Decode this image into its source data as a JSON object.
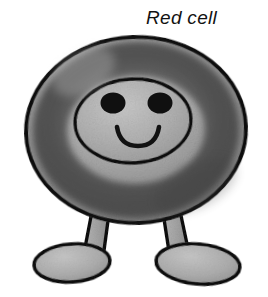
{
  "illustration": {
    "title": "Red cell",
    "subject": "cartoon red blood cell character",
    "style": "hand-drawn grayscale ink and wash sketch",
    "background_color": "#ffffff",
    "outline_color": "#121212",
    "label": {
      "text": "Red cell",
      "color": "#121212",
      "style": "italic",
      "position": "top-right"
    },
    "palette": {
      "outline": "#121212",
      "body_rim_light": "#a8a8a8",
      "body_ring_dark": "#525252",
      "body_center_light": "#b4b4b4",
      "leg_fill": "#a0a0a0",
      "foot_fill": "#b0b0b0",
      "eye_fill": "#101010",
      "mouth_stroke": "#121212",
      "background": "#ffffff"
    },
    "parts": [
      {
        "name": "body",
        "shape": "torus / biconcave disc seen face-on",
        "fill": "#a8a8a8"
      },
      {
        "name": "outer-ring",
        "shape": "dark annulus band",
        "fill": "#525252"
      },
      {
        "name": "inner-disc",
        "shape": "oval depression holding the face",
        "fill": "#b4b4b4"
      },
      {
        "name": "left-eye",
        "shape": "filled oval",
        "fill": "#101010"
      },
      {
        "name": "right-eye",
        "shape": "filled oval",
        "fill": "#101010"
      },
      {
        "name": "mouth",
        "shape": "upturned smile curve",
        "stroke": "#121212"
      },
      {
        "name": "left-leg",
        "shape": "tapered column angled outward",
        "fill": "#a0a0a0"
      },
      {
        "name": "right-leg",
        "shape": "tapered column angled outward",
        "fill": "#a0a0a0"
      },
      {
        "name": "left-foot",
        "shape": "oval pointing left",
        "fill": "#b0b0b0"
      },
      {
        "name": "right-foot",
        "shape": "oval pointing right",
        "fill": "#b0b0b0"
      }
    ]
  }
}
